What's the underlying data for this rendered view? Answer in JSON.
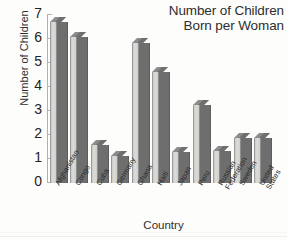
{
  "chart_data": {
    "type": "bar",
    "title": "Number of Children Born per Woman",
    "title_lines": [
      "Number of Children",
      "Born per Woman"
    ],
    "xlabel": "Country",
    "ylabel": "Number of Children",
    "ylim": [
      0,
      7
    ],
    "yticks": [
      "0",
      "1",
      "2",
      "3",
      "4",
      "5",
      "6",
      "7"
    ],
    "ytick_values": [
      0,
      1,
      2,
      3,
      4,
      5,
      6,
      7
    ],
    "grid": false,
    "legend": "none",
    "categories": [
      "Afghanistan",
      "Congo",
      "Cuba",
      "Germany",
      "Ghana",
      "Haiti",
      "Japan",
      "Peru",
      "Russian Federation",
      "Sweden",
      "United States"
    ],
    "category_lines": [
      [
        "Afghanistan"
      ],
      [
        "Congo"
      ],
      [
        "Cuba"
      ],
      [
        "Germany"
      ],
      [
        "Ghana"
      ],
      [
        "Haiti"
      ],
      [
        "Japan"
      ],
      [
        "Peru"
      ],
      [
        "Russian",
        "Federation"
      ],
      [
        "Sweden"
      ],
      [
        "United",
        "States"
      ]
    ],
    "values": [
      6.9,
      6.3,
      1.8,
      1.35,
      6.05,
      4.85,
      1.5,
      3.45,
      1.55,
      2.1,
      2.1
    ],
    "colors": {
      "bar_front": "#d8d8d5",
      "bar_side": "#6e6e6e",
      "bar_top": "#8c8c8c",
      "axis": "#b0b0b0",
      "text": "#2b2b2b",
      "background": "#fdfdfc"
    }
  }
}
